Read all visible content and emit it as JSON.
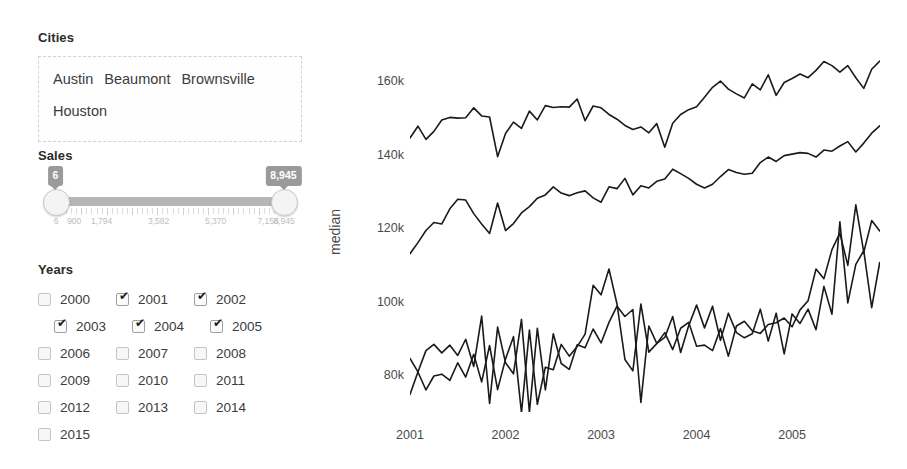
{
  "cities": {
    "label": "Cities",
    "selected": [
      "Austin",
      "Beaumont",
      "Brownsville",
      "Houston"
    ]
  },
  "sales": {
    "label": "Sales",
    "min_value": "6",
    "max_value": "8,945",
    "scale_ticks": [
      "6",
      "900",
      "1,794",
      "3,582",
      "5,370",
      "7,158",
      "8,945"
    ],
    "scale_positions": [
      0,
      8,
      20,
      45,
      70,
      93,
      100
    ]
  },
  "years": {
    "label": "Years",
    "rows": [
      [
        {
          "label": "2000",
          "checked": false
        },
        {
          "label": "2001",
          "checked": true
        },
        {
          "label": "2002",
          "checked": true
        }
      ],
      [
        {
          "label": "2003",
          "checked": true
        },
        {
          "label": "2004",
          "checked": true
        },
        {
          "label": "2005",
          "checked": true
        }
      ],
      [
        {
          "label": "2006",
          "checked": false
        },
        {
          "label": "2007",
          "checked": false
        },
        {
          "label": "2008",
          "checked": false
        }
      ],
      [
        {
          "label": "2009",
          "checked": false
        },
        {
          "label": "2010",
          "checked": false
        },
        {
          "label": "2011",
          "checked": false
        }
      ],
      [
        {
          "label": "2012",
          "checked": false
        },
        {
          "label": "2013",
          "checked": false
        },
        {
          "label": "2014",
          "checked": false
        }
      ],
      [
        {
          "label": "2015",
          "checked": false
        }
      ]
    ]
  },
  "chart_data": {
    "type": "line",
    "title": "",
    "xlabel": "",
    "ylabel": "median",
    "grid": false,
    "legend": "none",
    "line_color": "#1a1a1a",
    "line_width": 1.6,
    "xlim": [
      2001.0,
      2005.92
    ],
    "ylim": [
      70000,
      168000
    ],
    "xticks": [
      2001,
      2002,
      2003,
      2004,
      2005
    ],
    "xtick_labels": [
      "2001",
      "2002",
      "2003",
      "2004",
      "2005"
    ],
    "yticks": [
      80000,
      100000,
      120000,
      140000,
      160000
    ],
    "ytick_labels": [
      "80k",
      "100k",
      "120k",
      "140k",
      "160k"
    ],
    "x": [
      2001.0,
      2001.083,
      2001.167,
      2001.25,
      2001.333,
      2001.417,
      2001.5,
      2001.583,
      2001.667,
      2001.75,
      2001.833,
      2001.917,
      2002.0,
      2002.083,
      2002.167,
      2002.25,
      2002.333,
      2002.417,
      2002.5,
      2002.583,
      2002.667,
      2002.75,
      2002.833,
      2002.917,
      2003.0,
      2003.083,
      2003.167,
      2003.25,
      2003.333,
      2003.417,
      2003.5,
      2003.583,
      2003.667,
      2003.75,
      2003.833,
      2003.917,
      2004.0,
      2004.083,
      2004.167,
      2004.25,
      2004.333,
      2004.417,
      2004.5,
      2004.583,
      2004.667,
      2004.75,
      2004.833,
      2004.917,
      2005.0,
      2005.083,
      2005.167,
      2005.25,
      2005.333,
      2005.417,
      2005.5,
      2005.583,
      2005.667,
      2005.75,
      2005.833,
      2005.917
    ],
    "series": [
      {
        "name": "Austin",
        "values": [
          144600,
          147800,
          144200,
          146400,
          149500,
          150200,
          150000,
          150100,
          152800,
          150600,
          150300,
          139500,
          145800,
          148900,
          147200,
          151900,
          149500,
          153400,
          152900,
          153100,
          153000,
          155200,
          149300,
          153300,
          152800,
          151000,
          149700,
          148000,
          146900,
          147600,
          146000,
          148500,
          142100,
          148600,
          151000,
          152300,
          153100,
          155700,
          158400,
          160100,
          157900,
          156600,
          155500,
          159300,
          157700,
          161800,
          156200,
          159700,
          160800,
          162000,
          161000,
          163000,
          165400,
          164300,
          162500,
          164300,
          161000,
          158100,
          163300,
          165500
        ]
      },
      {
        "name": "Houston",
        "values": [
          113100,
          116100,
          119400,
          121600,
          121200,
          125300,
          127900,
          127700,
          124000,
          121200,
          118600,
          126900,
          119400,
          121300,
          124200,
          125900,
          128200,
          129100,
          131300,
          129600,
          128900,
          129700,
          130200,
          128300,
          127100,
          131300,
          130800,
          133600,
          129100,
          131600,
          131000,
          132800,
          133400,
          136100,
          134900,
          133600,
          132000,
          131000,
          132000,
          134100,
          136000,
          135200,
          134700,
          135000,
          137900,
          139400,
          138200,
          139800,
          140200,
          140600,
          140400,
          139400,
          141300,
          141000,
          142400,
          143600,
          140800,
          143200,
          145900,
          147900
        ]
      },
      {
        "name": "Beaumont",
        "values": [
          84600,
          80900,
          86700,
          88400,
          86100,
          88200,
          85400,
          89800,
          82400,
          96100,
          72300,
          93100,
          83400,
          80400,
          95200,
          69900,
          92800,
          76000,
          91300,
          83200,
          81600,
          88300,
          87500,
          92600,
          88800,
          94400,
          98800,
          96000,
          97900,
          72600,
          93400,
          88700,
          90300,
          96000,
          86200,
          93500,
          99100,
          92900,
          98800,
          89500,
          96900,
          91600,
          90200,
          91300,
          98000,
          89300,
          96900,
          85800,
          96700,
          94100,
          98000,
          92400,
          104200,
          96600,
          121800,
          99700,
          110200,
          113900,
          98400,
          110700
        ]
      },
      {
        "name": "Brownsville",
        "values": [
          74800,
          80900,
          76000,
          79800,
          80300,
          78600,
          83400,
          79500,
          85700,
          78200,
          88100,
          76100,
          84400,
          90500,
          69800,
          92300,
          72100,
          82200,
          81500,
          88400,
          85200,
          87800,
          91200,
          104500,
          101900,
          108900,
          99400,
          84300,
          81200,
          99400,
          86300,
          88600,
          91600,
          87000,
          92800,
          94400,
          87900,
          88200,
          86700,
          92700,
          85200,
          93400,
          94700,
          92100,
          91400,
          93800,
          94300,
          95600,
          93200,
          97800,
          100300,
          108900,
          106300,
          114200,
          118700,
          109900,
          126400,
          113500,
          122100,
          119300
        ]
      }
    ]
  }
}
